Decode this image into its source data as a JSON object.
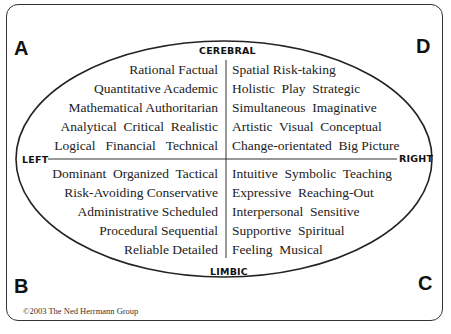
{
  "diagram": {
    "type": "Herrmann Whole Brain Model",
    "quadrants": {
      "A": {
        "letter": "A",
        "position": "upper-left",
        "traits": [
          "Rational Factual",
          "Quantitative Academic",
          "Mathematical Authoritarian",
          "Analytical  Critical  Realistic",
          "Logical   Financial   Technical"
        ]
      },
      "D": {
        "letter": "D",
        "position": "upper-right",
        "traits": [
          "Spatial Risk-taking",
          "Holistic  Play  Strategic",
          "Simultaneous  Imaginative",
          "Artistic  Visual  Conceptual",
          "Change-orientated  Big Picture"
        ]
      },
      "B": {
        "letter": "B",
        "position": "lower-left",
        "traits": [
          "Dominant  Organized  Tactical",
          "Risk-Avoiding Conservative",
          "Administrative Scheduled",
          "Procedural Sequential",
          "Reliable Detailed"
        ]
      },
      "C": {
        "letter": "C",
        "position": "lower-right",
        "traits": [
          "Intuitive  Symbolic  Teaching",
          "Expressive  Reaching-Out",
          "Interpersonal  Sensitive",
          "Supportive  Spiritual",
          "Feeling  Musical"
        ]
      }
    },
    "axes": {
      "top": "CEREBRAL",
      "bottom": "LIMBIC",
      "left": "LEFT",
      "right": "RIGHT"
    },
    "copyright": "©2003 The Ned Herrmann Group"
  },
  "colors": {
    "line": "#222222",
    "text": "#222222",
    "background": "#ffffff"
  }
}
